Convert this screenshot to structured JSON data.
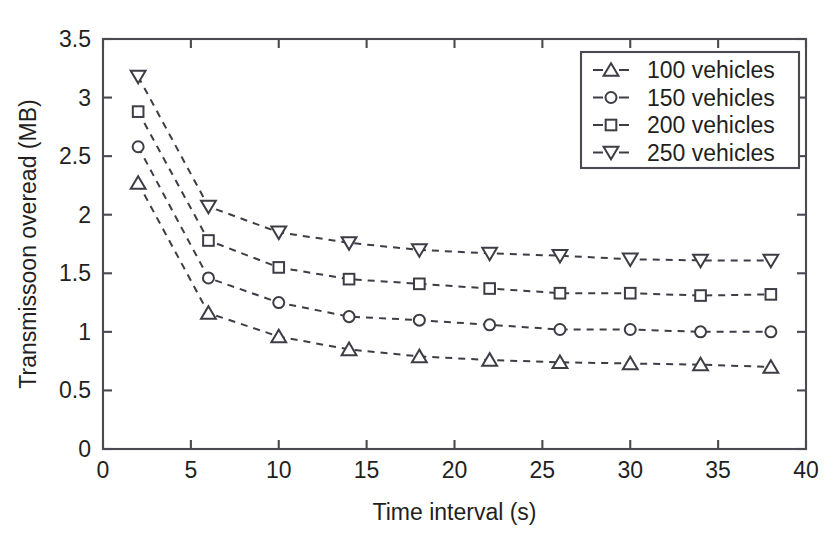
{
  "chart_data": {
    "type": "line",
    "title": "",
    "xlabel": "Time interval (s)",
    "ylabel": "Transmissoon overead (MB)",
    "xlim": [
      0,
      40
    ],
    "ylim": [
      0,
      3.5
    ],
    "xticks": [
      0,
      5,
      10,
      15,
      20,
      25,
      30,
      35,
      40
    ],
    "xtick_labels": [
      "0",
      "5",
      "10",
      "15",
      "20",
      "25",
      "30",
      "35",
      "40"
    ],
    "yticks": [
      0,
      0.5,
      1,
      1.5,
      2,
      2.5,
      3,
      3.5
    ],
    "ytick_labels": [
      "0",
      "0.5",
      "1",
      "1.5",
      "2",
      "2.5",
      "3",
      "3.5"
    ],
    "grid": false,
    "legend_position": "upper right",
    "x": [
      2,
      6,
      10,
      14,
      18,
      22,
      26,
      30,
      34,
      38
    ],
    "series": [
      {
        "name": "100 vehicles",
        "marker": "triangle-up",
        "linestyle": "dashed",
        "color": "#3d3d46",
        "values": [
          2.27,
          1.16,
          0.96,
          0.85,
          0.79,
          0.76,
          0.74,
          0.73,
          0.72,
          0.7
        ]
      },
      {
        "name": "150 vehicles",
        "marker": "circle",
        "linestyle": "dashed",
        "color": "#3d3d46",
        "values": [
          2.58,
          1.46,
          1.25,
          1.13,
          1.1,
          1.06,
          1.02,
          1.02,
          1.0,
          1.0
        ]
      },
      {
        "name": "200 vehicles",
        "marker": "square",
        "linestyle": "dashed",
        "color": "#3d3d46",
        "values": [
          2.88,
          1.78,
          1.55,
          1.45,
          1.41,
          1.37,
          1.33,
          1.33,
          1.31,
          1.32
        ]
      },
      {
        "name": "250 vehicles",
        "marker": "triangle-down",
        "linestyle": "dashed",
        "color": "#3d3d46",
        "values": [
          3.18,
          2.07,
          1.85,
          1.76,
          1.7,
          1.67,
          1.65,
          1.62,
          1.61,
          1.61
        ]
      }
    ]
  },
  "legend": {
    "entries": [
      {
        "label": "100 vehicles",
        "marker": "triangle-up"
      },
      {
        "label": "150 vehicles",
        "marker": "circle"
      },
      {
        "label": "200 vehicles",
        "marker": "square"
      },
      {
        "label": "250 vehicles",
        "marker": "triangle-down"
      }
    ]
  },
  "colors": {
    "axis": "#4a4a52",
    "series": "#3d3d46",
    "background": "#ffffff",
    "text": "#231f20"
  }
}
